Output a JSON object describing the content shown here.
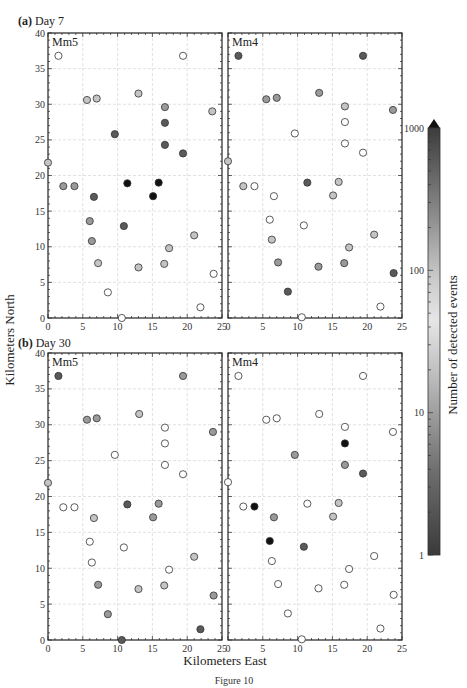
{
  "figure": {
    "caption": "Figure 10",
    "xlabel": "Kilometers East",
    "ylabel": "Kilometers North",
    "colorbar": {
      "label": "Number of detected events",
      "ticks": [
        "1000",
        "100",
        "10",
        "1"
      ],
      "scale": "log",
      "range": [
        1,
        1000
      ],
      "extend": "max"
    }
  },
  "chart_data": [
    {
      "type": "scatter",
      "title": "(a) Day 7",
      "panel": "Mm5",
      "xlabel": "Kilometers East",
      "ylabel": "Kilometers North",
      "xlim": [
        0,
        25
      ],
      "ylim": [
        0,
        40
      ],
      "xticks": [
        0,
        5,
        10,
        15,
        20,
        25
      ],
      "yticks": [
        0,
        5,
        10,
        15,
        20,
        25,
        30,
        35,
        40
      ],
      "grid": true,
      "shade_legend": {
        "w": "open (~30-60 events)",
        "l": "light gray",
        "m": "medium gray",
        "d": "dark gray",
        "k": "black (~1 or ~1000)"
      },
      "points": [
        {
          "x": 1.5,
          "y": 36.8,
          "s": "w"
        },
        {
          "x": 19.4,
          "y": 36.8,
          "s": "w"
        },
        {
          "x": 5.6,
          "y": 30.6,
          "s": "l"
        },
        {
          "x": 7.0,
          "y": 30.8,
          "s": "l"
        },
        {
          "x": 13.0,
          "y": 31.5,
          "s": "l"
        },
        {
          "x": 16.8,
          "y": 29.6,
          "s": "m"
        },
        {
          "x": 23.6,
          "y": 29.0,
          "s": "l"
        },
        {
          "x": 9.6,
          "y": 25.8,
          "s": "d"
        },
        {
          "x": 16.8,
          "y": 27.4,
          "s": "d"
        },
        {
          "x": 16.8,
          "y": 24.3,
          "s": "d"
        },
        {
          "x": 19.4,
          "y": 23.1,
          "s": "d"
        },
        {
          "x": 0.0,
          "y": 21.8,
          "s": "l"
        },
        {
          "x": 2.2,
          "y": 18.5,
          "s": "m"
        },
        {
          "x": 3.8,
          "y": 18.5,
          "s": "m"
        },
        {
          "x": 6.6,
          "y": 17.0,
          "s": "d"
        },
        {
          "x": 11.4,
          "y": 18.9,
          "s": "k"
        },
        {
          "x": 15.1,
          "y": 17.1,
          "s": "k"
        },
        {
          "x": 15.9,
          "y": 19.0,
          "s": "k"
        },
        {
          "x": 6.0,
          "y": 13.6,
          "s": "m"
        },
        {
          "x": 10.9,
          "y": 12.9,
          "s": "d"
        },
        {
          "x": 6.3,
          "y": 10.8,
          "s": "m"
        },
        {
          "x": 21.0,
          "y": 11.6,
          "s": "l"
        },
        {
          "x": 17.4,
          "y": 9.8,
          "s": "l"
        },
        {
          "x": 7.2,
          "y": 7.7,
          "s": "l"
        },
        {
          "x": 13.0,
          "y": 7.1,
          "s": "l"
        },
        {
          "x": 16.7,
          "y": 7.6,
          "s": "l"
        },
        {
          "x": 23.8,
          "y": 6.2,
          "s": "w"
        },
        {
          "x": 8.6,
          "y": 3.6,
          "s": "w"
        },
        {
          "x": 21.9,
          "y": 1.5,
          "s": "w"
        },
        {
          "x": 10.6,
          "y": 0.0,
          "s": "w"
        }
      ]
    },
    {
      "type": "scatter",
      "title": "(a) Day 7",
      "panel": "Mm4",
      "xlim": [
        0,
        25
      ],
      "ylim": [
        0,
        40
      ],
      "points": [
        {
          "x": 1.5,
          "y": 36.8,
          "s": "d"
        },
        {
          "x": 19.4,
          "y": 36.8,
          "s": "d"
        },
        {
          "x": 5.5,
          "y": 30.7,
          "s": "m"
        },
        {
          "x": 7.0,
          "y": 30.9,
          "s": "m"
        },
        {
          "x": 13.1,
          "y": 31.6,
          "s": "m"
        },
        {
          "x": 16.8,
          "y": 29.7,
          "s": "l"
        },
        {
          "x": 23.7,
          "y": 29.2,
          "s": "m"
        },
        {
          "x": 9.6,
          "y": 25.9,
          "s": "w"
        },
        {
          "x": 16.8,
          "y": 27.5,
          "s": "w"
        },
        {
          "x": 16.8,
          "y": 24.5,
          "s": "w"
        },
        {
          "x": 19.4,
          "y": 23.2,
          "s": "w"
        },
        {
          "x": 0.0,
          "y": 22.0,
          "s": "l"
        },
        {
          "x": 2.2,
          "y": 18.5,
          "s": "l"
        },
        {
          "x": 3.8,
          "y": 18.5,
          "s": "w"
        },
        {
          "x": 6.6,
          "y": 17.1,
          "s": "w"
        },
        {
          "x": 11.4,
          "y": 19.0,
          "s": "d"
        },
        {
          "x": 15.1,
          "y": 17.2,
          "s": "l"
        },
        {
          "x": 15.9,
          "y": 19.1,
          "s": "l"
        },
        {
          "x": 6.0,
          "y": 13.8,
          "s": "w"
        },
        {
          "x": 10.9,
          "y": 13.0,
          "s": "w"
        },
        {
          "x": 6.3,
          "y": 11.0,
          "s": "l"
        },
        {
          "x": 21.0,
          "y": 11.7,
          "s": "l"
        },
        {
          "x": 17.4,
          "y": 9.9,
          "s": "l"
        },
        {
          "x": 7.2,
          "y": 7.8,
          "s": "m"
        },
        {
          "x": 13.0,
          "y": 7.2,
          "s": "m"
        },
        {
          "x": 16.7,
          "y": 7.7,
          "s": "m"
        },
        {
          "x": 23.8,
          "y": 6.3,
          "s": "d"
        },
        {
          "x": 8.6,
          "y": 3.7,
          "s": "d"
        },
        {
          "x": 21.9,
          "y": 1.6,
          "s": "w"
        },
        {
          "x": 10.6,
          "y": 0.1,
          "s": "w"
        }
      ]
    },
    {
      "type": "scatter",
      "title": "(b) Day 30",
      "panel": "Mm5",
      "xlim": [
        0,
        25
      ],
      "ylim": [
        0,
        40
      ],
      "points": [
        {
          "x": 1.5,
          "y": 36.8,
          "s": "d"
        },
        {
          "x": 19.4,
          "y": 36.8,
          "s": "m"
        },
        {
          "x": 5.6,
          "y": 30.7,
          "s": "m"
        },
        {
          "x": 7.0,
          "y": 30.9,
          "s": "m"
        },
        {
          "x": 13.1,
          "y": 31.5,
          "s": "l"
        },
        {
          "x": 16.8,
          "y": 29.6,
          "s": "w"
        },
        {
          "x": 23.7,
          "y": 29.0,
          "s": "m"
        },
        {
          "x": 9.6,
          "y": 25.8,
          "s": "w"
        },
        {
          "x": 16.8,
          "y": 27.4,
          "s": "w"
        },
        {
          "x": 16.8,
          "y": 24.4,
          "s": "w"
        },
        {
          "x": 19.4,
          "y": 23.1,
          "s": "w"
        },
        {
          "x": 0.0,
          "y": 21.9,
          "s": "l"
        },
        {
          "x": 2.2,
          "y": 18.5,
          "s": "w"
        },
        {
          "x": 3.8,
          "y": 18.5,
          "s": "w"
        },
        {
          "x": 6.6,
          "y": 17.0,
          "s": "l"
        },
        {
          "x": 11.4,
          "y": 18.9,
          "s": "d"
        },
        {
          "x": 15.1,
          "y": 17.1,
          "s": "m"
        },
        {
          "x": 15.9,
          "y": 19.0,
          "s": "m"
        },
        {
          "x": 6.0,
          "y": 13.7,
          "s": "w"
        },
        {
          "x": 10.9,
          "y": 12.9,
          "s": "w"
        },
        {
          "x": 6.3,
          "y": 10.8,
          "s": "w"
        },
        {
          "x": 21.0,
          "y": 11.6,
          "s": "l"
        },
        {
          "x": 17.4,
          "y": 9.8,
          "s": "w"
        },
        {
          "x": 7.2,
          "y": 7.7,
          "s": "m"
        },
        {
          "x": 13.0,
          "y": 7.1,
          "s": "l"
        },
        {
          "x": 16.7,
          "y": 7.6,
          "s": "l"
        },
        {
          "x": 23.8,
          "y": 6.2,
          "s": "m"
        },
        {
          "x": 8.6,
          "y": 3.6,
          "s": "m"
        },
        {
          "x": 21.9,
          "y": 1.5,
          "s": "d"
        },
        {
          "x": 10.6,
          "y": 0.0,
          "s": "d"
        }
      ]
    },
    {
      "type": "scatter",
      "title": "(b) Day 30",
      "panel": "Mm4",
      "xlim": [
        0,
        25
      ],
      "ylim": [
        0,
        40
      ],
      "points": [
        {
          "x": 1.5,
          "y": 36.8,
          "s": "w"
        },
        {
          "x": 19.4,
          "y": 36.8,
          "s": "w"
        },
        {
          "x": 5.5,
          "y": 30.7,
          "s": "w"
        },
        {
          "x": 7.0,
          "y": 30.9,
          "s": "w"
        },
        {
          "x": 13.1,
          "y": 31.5,
          "s": "w"
        },
        {
          "x": 16.8,
          "y": 29.7,
          "s": "w"
        },
        {
          "x": 23.7,
          "y": 29.0,
          "s": "w"
        },
        {
          "x": 9.6,
          "y": 25.8,
          "s": "m"
        },
        {
          "x": 16.8,
          "y": 27.4,
          "s": "k"
        },
        {
          "x": 16.8,
          "y": 24.4,
          "s": "m"
        },
        {
          "x": 19.4,
          "y": 23.2,
          "s": "d"
        },
        {
          "x": 0.0,
          "y": 22.0,
          "s": "w"
        },
        {
          "x": 2.2,
          "y": 18.6,
          "s": "w"
        },
        {
          "x": 3.8,
          "y": 18.6,
          "s": "k"
        },
        {
          "x": 6.6,
          "y": 17.1,
          "s": "m"
        },
        {
          "x": 11.4,
          "y": 19.0,
          "s": "w"
        },
        {
          "x": 15.1,
          "y": 17.2,
          "s": "l"
        },
        {
          "x": 15.9,
          "y": 19.1,
          "s": "l"
        },
        {
          "x": 6.0,
          "y": 13.8,
          "s": "k"
        },
        {
          "x": 10.9,
          "y": 13.0,
          "s": "d"
        },
        {
          "x": 6.3,
          "y": 11.0,
          "s": "w"
        },
        {
          "x": 21.0,
          "y": 11.7,
          "s": "w"
        },
        {
          "x": 17.4,
          "y": 9.9,
          "s": "w"
        },
        {
          "x": 7.2,
          "y": 7.8,
          "s": "w"
        },
        {
          "x": 13.0,
          "y": 7.2,
          "s": "w"
        },
        {
          "x": 16.7,
          "y": 7.7,
          "s": "w"
        },
        {
          "x": 23.8,
          "y": 6.3,
          "s": "w"
        },
        {
          "x": 8.6,
          "y": 3.7,
          "s": "w"
        },
        {
          "x": 21.9,
          "y": 1.6,
          "s": "w"
        },
        {
          "x": 10.6,
          "y": 0.1,
          "s": "w"
        }
      ]
    }
  ]
}
